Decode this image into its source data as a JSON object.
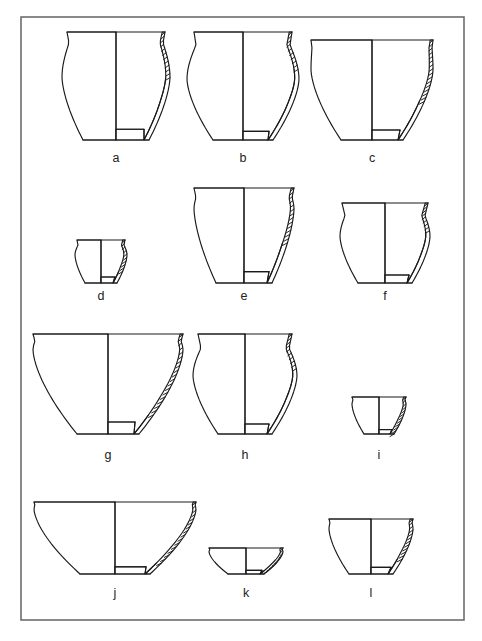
{
  "figure": {
    "type": "archaeological-pottery-profile-plate",
    "background_color": "#ffffff",
    "line_color": "#1a1a1a",
    "frame_color": "#6d6d6d",
    "label_color": "#222222",
    "rows": 4,
    "columns": 3,
    "item_count": 12
  },
  "frame": {
    "x": 21,
    "y": 17,
    "width": 443,
    "height": 603,
    "stroke_width": 1.6
  },
  "vessels": [
    {
      "id": "a",
      "label": "a",
      "label_x": 116,
      "label_y": 162,
      "shape": "ovoid jar with everted rim",
      "axis_x": 116,
      "rim_y": 32,
      "base_y": 140,
      "rim_half_width": 49,
      "max_half_width": 54,
      "base_half_width": 33,
      "belly_y_frac": 0.42,
      "rim_flare": 4,
      "neck_y_frac": 0.1,
      "neck_half_width": 47,
      "wall_thickness": 5,
      "hatch_end_frac": 0.42,
      "hatch_count": 11,
      "interior_base_y_frac": 0.9,
      "interior_base_half_width": 28
    },
    {
      "id": "b",
      "label": "b",
      "label_x": 243,
      "label_y": 162,
      "shape": "globular jar with short everted rim",
      "axis_x": 243,
      "rim_y": 32,
      "base_y": 140,
      "rim_half_width": 49,
      "max_half_width": 56,
      "base_half_width": 30,
      "belly_y_frac": 0.44,
      "rim_flare": 3,
      "neck_y_frac": 0.12,
      "neck_half_width": 47,
      "wall_thickness": 5,
      "hatch_end_frac": 0.33,
      "hatch_count": 9,
      "interior_base_y_frac": 0.92,
      "interior_base_half_width": 26
    },
    {
      "id": "c",
      "label": "c",
      "label_x": 372,
      "label_y": 162,
      "shape": "wide hemispherical bowl with flat rim",
      "axis_x": 372,
      "rim_y": 40,
      "base_y": 140,
      "rim_half_width": 61,
      "max_half_width": 61,
      "base_half_width": 31,
      "belly_y_frac": 0.3,
      "rim_flare": 1,
      "neck_y_frac": 0.08,
      "neck_half_width": 60,
      "wall_thickness": 5,
      "hatch_end_frac": 0.62,
      "hatch_count": 15,
      "interior_base_y_frac": 0.9,
      "interior_base_half_width": 28
    },
    {
      "id": "d",
      "label": "d",
      "label_x": 101,
      "label_y": 300,
      "shape": "small cup with slightly everted rim",
      "axis_x": 101,
      "rim_y": 240,
      "base_y": 283,
      "rim_half_width": 24,
      "max_half_width": 26,
      "base_half_width": 16,
      "belly_y_frac": 0.35,
      "rim_flare": 2,
      "neck_y_frac": 0.12,
      "neck_half_width": 23,
      "wall_thickness": 4,
      "hatch_end_frac": 0.72,
      "hatch_count": 9,
      "interior_base_y_frac": 0.86,
      "interior_base_half_width": 14
    },
    {
      "id": "e",
      "label": "e",
      "label_x": 244,
      "label_y": 300,
      "shape": "deep jar with wide flat rim and carinated body",
      "axis_x": 244,
      "rim_y": 188,
      "base_y": 283,
      "rim_half_width": 50,
      "max_half_width": 50,
      "base_half_width": 28,
      "belly_y_frac": 0.22,
      "rim_flare": 2,
      "neck_y_frac": 0.1,
      "neck_half_width": 48,
      "wall_thickness": 5,
      "hatch_end_frac": 0.56,
      "hatch_count": 13,
      "interior_base_y_frac": 0.88,
      "interior_base_half_width": 25
    },
    {
      "id": "f",
      "label": "f",
      "label_x": 385,
      "label_y": 300,
      "shape": "jar with short flaring rim and rounded body",
      "axis_x": 385,
      "rim_y": 203,
      "base_y": 283,
      "rim_half_width": 43,
      "max_half_width": 45,
      "base_half_width": 27,
      "belly_y_frac": 0.42,
      "rim_flare": 3,
      "neck_y_frac": 0.16,
      "neck_half_width": 40,
      "wall_thickness": 5,
      "hatch_end_frac": 0.33,
      "hatch_count": 8,
      "interior_base_y_frac": 0.9,
      "interior_base_half_width": 24
    },
    {
      "id": "g",
      "label": "g",
      "label_x": 108,
      "label_y": 459,
      "shape": "large flaring open bowl with wide rim",
      "axis_x": 108,
      "rim_y": 334,
      "base_y": 434,
      "rim_half_width": 75,
      "max_half_width": 75,
      "base_half_width": 31,
      "belly_y_frac": 0.16,
      "rim_flare": 2,
      "neck_y_frac": 0.07,
      "neck_half_width": 73,
      "wall_thickness": 5,
      "hatch_end_frac": 0.82,
      "hatch_count": 18,
      "interior_base_y_frac": 0.88,
      "interior_base_half_width": 27
    },
    {
      "id": "h",
      "label": "h",
      "label_x": 245,
      "label_y": 459,
      "shape": "jar with everted rim and rounded shoulder",
      "axis_x": 245,
      "rim_y": 334,
      "base_y": 434,
      "rim_half_width": 47,
      "max_half_width": 52,
      "base_half_width": 27,
      "belly_y_frac": 0.42,
      "rim_flare": 4,
      "neck_y_frac": 0.14,
      "neck_half_width": 44,
      "wall_thickness": 5,
      "hatch_end_frac": 0.36,
      "hatch_count": 9,
      "interior_base_y_frac": 0.9,
      "interior_base_half_width": 24
    },
    {
      "id": "i",
      "label": "i",
      "label_x": 379,
      "label_y": 459,
      "shape": "small shallow cup with straight rim",
      "axis_x": 379,
      "rim_y": 397,
      "base_y": 434,
      "rim_half_width": 27,
      "max_half_width": 27,
      "base_half_width": 15,
      "belly_y_frac": 0.2,
      "rim_flare": 1,
      "neck_y_frac": 0.08,
      "neck_half_width": 26,
      "wall_thickness": 4,
      "hatch_end_frac": 1.0,
      "hatch_count": 11,
      "interior_base_y_frac": 0.88,
      "interior_base_half_width": 13
    },
    {
      "id": "j",
      "label": "j",
      "label_x": 115,
      "label_y": 597,
      "shape": "large conical flaring bowl",
      "axis_x": 115,
      "rim_y": 502,
      "base_y": 574,
      "rim_half_width": 81,
      "max_half_width": 81,
      "base_half_width": 35,
      "belly_y_frac": 0.1,
      "rim_flare": 1,
      "neck_y_frac": 0.05,
      "neck_half_width": 80,
      "wall_thickness": 5,
      "hatch_end_frac": 0.86,
      "hatch_count": 15,
      "interior_base_y_frac": 0.9,
      "interior_base_half_width": 31
    },
    {
      "id": "k",
      "label": "k",
      "label_x": 246,
      "label_y": 597,
      "shape": "small shallow bowl with flat rim",
      "axis_x": 246,
      "rim_y": 548,
      "base_y": 574,
      "rim_half_width": 37,
      "max_half_width": 37,
      "base_half_width": 18,
      "belly_y_frac": 0.14,
      "rim_flare": 1,
      "neck_y_frac": 0.06,
      "neck_half_width": 36,
      "wall_thickness": 4,
      "hatch_end_frac": 0.9,
      "hatch_count": 9,
      "interior_base_y_frac": 0.86,
      "interior_base_half_width": 16
    },
    {
      "id": "l",
      "label": "l",
      "label_x": 371,
      "label_y": 597,
      "shape": "rounded deep bowl with straight rim",
      "axis_x": 371,
      "rim_y": 519,
      "base_y": 574,
      "rim_half_width": 42,
      "max_half_width": 42,
      "base_half_width": 22,
      "belly_y_frac": 0.18,
      "rim_flare": 1,
      "neck_y_frac": 0.07,
      "neck_half_width": 41,
      "wall_thickness": 5,
      "hatch_end_frac": 0.72,
      "hatch_count": 11,
      "interior_base_y_frac": 0.88,
      "interior_base_half_width": 20
    }
  ]
}
